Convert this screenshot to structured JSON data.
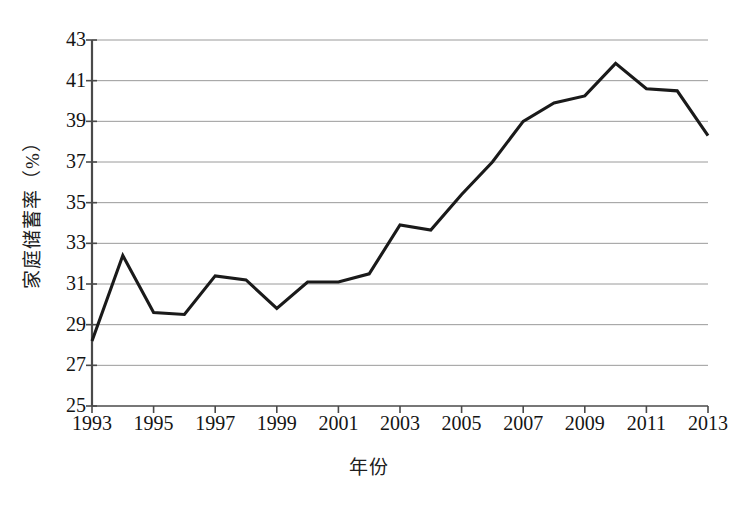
{
  "chart_data": {
    "type": "line",
    "title": "",
    "xlabel": "年份",
    "ylabel": "家庭储蓄率（%）",
    "x": [
      1993,
      1994,
      1995,
      1996,
      1997,
      1998,
      1999,
      2000,
      2001,
      2002,
      2003,
      2004,
      2005,
      2006,
      2007,
      2008,
      2009,
      2010,
      2011,
      2012,
      2013
    ],
    "values": [
      28.2,
      32.4,
      29.6,
      29.5,
      31.4,
      31.2,
      29.8,
      31.1,
      31.1,
      31.5,
      33.9,
      33.65,
      35.4,
      37.0,
      39.0,
      39.9,
      40.25,
      41.85,
      40.6,
      40.5,
      38.3
    ],
    "series": [
      {
        "name": "家庭储蓄率",
        "values": [
          28.2,
          32.4,
          29.6,
          29.5,
          31.4,
          31.2,
          29.8,
          31.1,
          31.1,
          31.5,
          33.9,
          33.65,
          35.4,
          37.0,
          39.0,
          39.9,
          40.25,
          41.85,
          40.6,
          40.5,
          38.3
        ]
      }
    ],
    "xlim": [
      1993,
      2013
    ],
    "ylim": [
      25,
      43
    ],
    "ytick_labels": [
      "43",
      "41",
      "39",
      "37",
      "35",
      "33",
      "31",
      "29",
      "27",
      "25"
    ],
    "ytick_values": [
      43,
      41,
      39,
      37,
      35,
      33,
      31,
      29,
      27,
      25
    ],
    "xtick_labels": [
      "1993",
      "1995",
      "1997",
      "1999",
      "2001",
      "2003",
      "2005",
      "2007",
      "2009",
      "2011",
      "2013"
    ],
    "xtick_values": [
      1993,
      1995,
      1997,
      1999,
      2001,
      2003,
      2005,
      2007,
      2009,
      2011,
      2013
    ],
    "grid": "horizontal",
    "legend": "none",
    "line_color": "#1a1a1a",
    "grid_color": "#9a9a9a",
    "axis_color": "#4a4a4a",
    "background_color": "#ffffff"
  }
}
